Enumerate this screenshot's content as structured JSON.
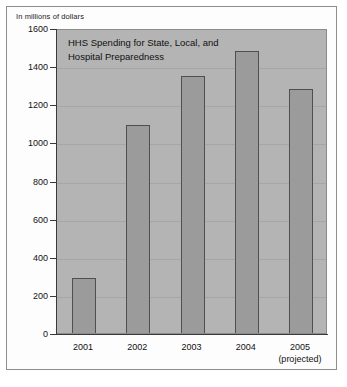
{
  "unit_label": "In millions of dollars",
  "chart_data": {
    "type": "bar",
    "title_lines": [
      "HHS Spending for State, Local, and",
      "Hospital Preparedness"
    ],
    "xlabel": "",
    "ylabel": "In millions of dollars",
    "categories": [
      "2001",
      "2002",
      "2003",
      "2004",
      "2005"
    ],
    "category_sublabels": [
      "",
      "",
      "",
      "",
      "(projected)"
    ],
    "values": [
      300,
      1100,
      1360,
      1490,
      1290
    ],
    "ylim": [
      0,
      1600
    ],
    "ytick_step": 200,
    "yticks": [
      "0",
      "200",
      "400",
      "600",
      "800",
      "1000",
      "1200",
      "1400",
      "1600"
    ],
    "grid": true,
    "legend": "none",
    "colors": {
      "bar_fill": "#9b9b9b",
      "bar_edge": "#4f4f4f",
      "plot_background": "#b4b4b4",
      "figure_background": "#fdfdfd",
      "axis": "#3a3a3a",
      "gridline": "#a6a6a6",
      "text": "#111111"
    }
  }
}
